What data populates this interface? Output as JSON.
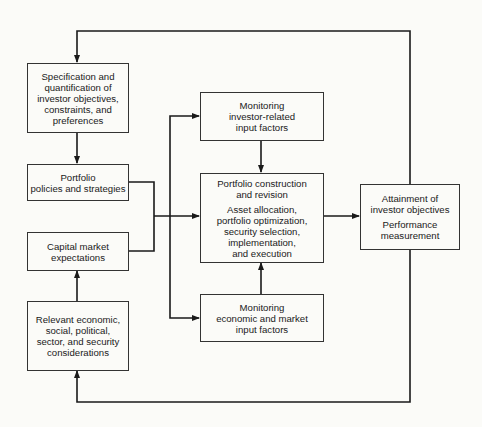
{
  "diagram": {
    "type": "flowchart",
    "colors": {
      "line": "#1a1a1a",
      "border": "#333333",
      "background": "#fbfbf8"
    },
    "nodes": {
      "specification": {
        "lines": [
          "Specification and",
          "quantification of",
          "investor objectives,",
          "constraints, and",
          "preferences"
        ]
      },
      "policies": {
        "lines": [
          "Portfolio",
          "policies and strategies"
        ]
      },
      "capital_market": {
        "lines": [
          "Capital market",
          "expectations"
        ]
      },
      "relevant": {
        "lines": [
          "Relevant economic,",
          "social, political,",
          "sector, and security",
          "considerations"
        ]
      },
      "monitoring_investor": {
        "lines": [
          "Monitoring",
          "investor-related",
          "input factors"
        ]
      },
      "construction": {
        "title_lines": [
          "Portfolio construction",
          "and revision"
        ],
        "detail_lines": [
          "Asset allocation,",
          "portfolio optimization,",
          "security selection,",
          "implementation,",
          "and execution"
        ]
      },
      "monitoring_economic": {
        "lines": [
          "Monitoring",
          "economic and market",
          "input factors"
        ]
      },
      "attainment": {
        "title_lines": [
          "Attainment of",
          "investor objectives"
        ],
        "detail_lines": [
          "Performance",
          "measurement"
        ]
      }
    },
    "edges": [
      {
        "from": "specification",
        "to": "policies"
      },
      {
        "from": "relevant",
        "to": "capital_market"
      },
      {
        "from": "policies",
        "to": "construction"
      },
      {
        "from": "capital_market",
        "to": "construction"
      },
      {
        "from": "policies+capital_market",
        "to": "monitoring_investor"
      },
      {
        "from": "policies+capital_market",
        "to": "monitoring_economic"
      },
      {
        "from": "monitoring_investor",
        "to": "construction"
      },
      {
        "from": "monitoring_economic",
        "to": "construction"
      },
      {
        "from": "construction",
        "to": "attainment"
      },
      {
        "from": "attainment",
        "to": "specification",
        "label": "feedback (top loop)"
      },
      {
        "from": "attainment",
        "to": "relevant",
        "label": "feedback (bottom loop)"
      }
    ]
  }
}
